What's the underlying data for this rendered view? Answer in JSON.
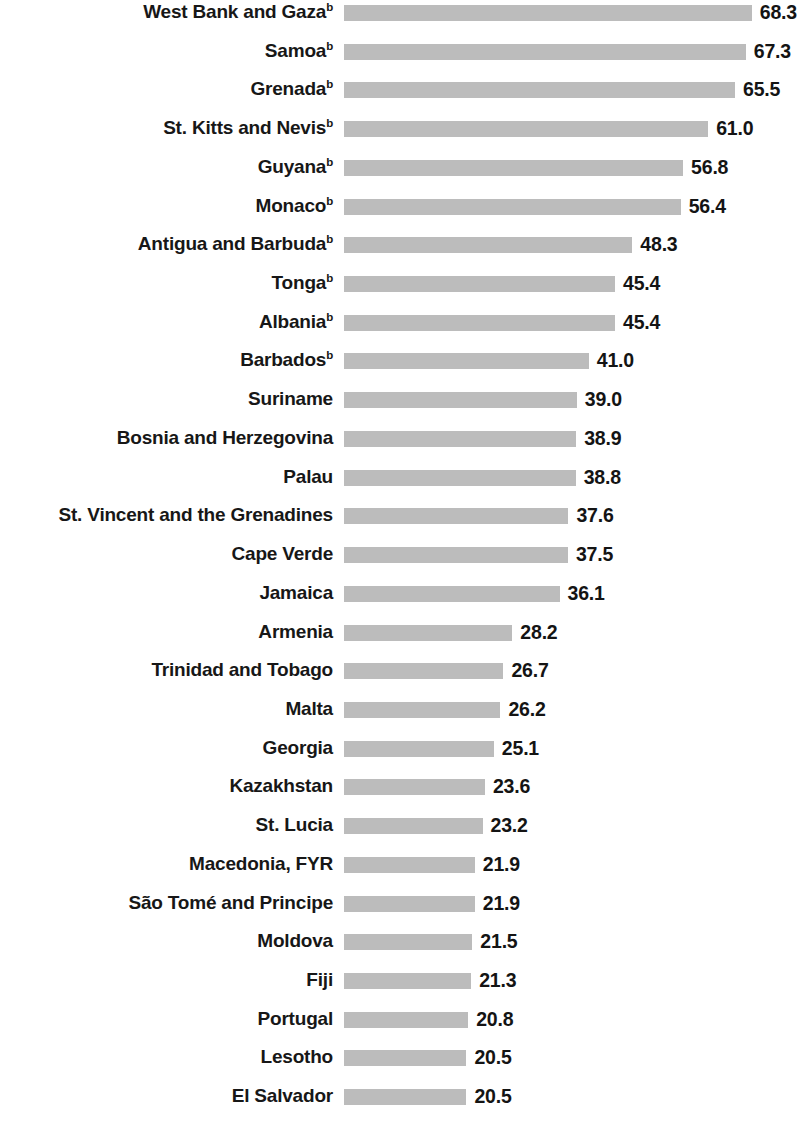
{
  "chart_data": {
    "type": "bar",
    "orientation": "horizontal",
    "title": "",
    "subtitle": "",
    "xlabel": "",
    "ylabel": "",
    "grid": false,
    "legend": null,
    "axis_visible": false,
    "value_label_format": "one decimal",
    "xlim": [
      0,
      68.3
    ],
    "bar_color": "#bcbcbc",
    "text_color": "#171717",
    "footnote_marker": "b",
    "categories": [
      "West Bank and Gaza",
      "Samoa",
      "Grenada",
      "St. Kitts and Nevis",
      "Guyana",
      "Monaco",
      "Antigua and Barbuda",
      "Tonga",
      "Albania",
      "Barbados",
      "Suriname",
      "Bosnia and Herzegovina",
      "Palau",
      "St. Vincent and the Grenadines",
      "Cape Verde",
      "Jamaica",
      "Armenia",
      "Trinidad and Tobago",
      "Malta",
      "Georgia",
      "Kazakhstan",
      "St. Lucia",
      "Macedonia, FYR",
      "São Tomé and Principe",
      "Moldova",
      "Fiji",
      "Portugal",
      "Lesotho",
      "El Salvador"
    ],
    "values": [
      68.3,
      67.3,
      65.5,
      61.0,
      56.8,
      56.4,
      48.3,
      45.4,
      45.4,
      41.0,
      39.0,
      38.9,
      38.8,
      37.6,
      37.5,
      36.1,
      28.2,
      26.7,
      26.2,
      25.1,
      23.6,
      23.2,
      21.9,
      21.9,
      21.5,
      21.3,
      20.8,
      20.5,
      20.5
    ],
    "rows": [
      {
        "label": "West Bank and Gaza",
        "marker": "b",
        "value": 68.3,
        "value_text": "68.3"
      },
      {
        "label": "Samoa",
        "marker": "b",
        "value": 67.3,
        "value_text": "67.3"
      },
      {
        "label": "Grenada",
        "marker": "b",
        "value": 65.5,
        "value_text": "65.5"
      },
      {
        "label": "St. Kitts and Nevis",
        "marker": "b",
        "value": 61.0,
        "value_text": "61.0"
      },
      {
        "label": "Guyana",
        "marker": "b",
        "value": 56.8,
        "value_text": "56.8"
      },
      {
        "label": "Monaco",
        "marker": "b",
        "value": 56.4,
        "value_text": "56.4"
      },
      {
        "label": "Antigua and Barbuda",
        "marker": "b",
        "value": 48.3,
        "value_text": "48.3"
      },
      {
        "label": "Tonga",
        "marker": "b",
        "value": 45.4,
        "value_text": "45.4"
      },
      {
        "label": "Albania",
        "marker": "b",
        "value": 45.4,
        "value_text": "45.4"
      },
      {
        "label": "Barbados",
        "marker": "b",
        "value": 41.0,
        "value_text": "41.0"
      },
      {
        "label": "Suriname",
        "marker": "",
        "value": 39.0,
        "value_text": "39.0"
      },
      {
        "label": "Bosnia and Herzegovina",
        "marker": "",
        "value": 38.9,
        "value_text": "38.9"
      },
      {
        "label": "Palau",
        "marker": "",
        "value": 38.8,
        "value_text": "38.8"
      },
      {
        "label": "St. Vincent and the Grenadines",
        "marker": "",
        "value": 37.6,
        "value_text": "37.6"
      },
      {
        "label": "Cape Verde",
        "marker": "",
        "value": 37.5,
        "value_text": "37.5"
      },
      {
        "label": "Jamaica",
        "marker": "",
        "value": 36.1,
        "value_text": "36.1"
      },
      {
        "label": "Armenia",
        "marker": "",
        "value": 28.2,
        "value_text": "28.2"
      },
      {
        "label": "Trinidad and Tobago",
        "marker": "",
        "value": 26.7,
        "value_text": "26.7"
      },
      {
        "label": "Malta",
        "marker": "",
        "value": 26.2,
        "value_text": "26.2"
      },
      {
        "label": "Georgia",
        "marker": "",
        "value": 25.1,
        "value_text": "25.1"
      },
      {
        "label": "Kazakhstan",
        "marker": "",
        "value": 23.6,
        "value_text": "23.6"
      },
      {
        "label": "St. Lucia",
        "marker": "",
        "value": 23.2,
        "value_text": "23.2"
      },
      {
        "label": "Macedonia, FYR",
        "marker": "",
        "value": 21.9,
        "value_text": "21.9"
      },
      {
        "label": "São Tomé and Principe",
        "marker": "",
        "value": 21.9,
        "value_text": "21.9"
      },
      {
        "label": "Moldova",
        "marker": "",
        "value": 21.5,
        "value_text": "21.5"
      },
      {
        "label": "Fiji",
        "marker": "",
        "value": 21.3,
        "value_text": "21.3"
      },
      {
        "label": "Portugal",
        "marker": "",
        "value": 20.8,
        "value_text": "20.8"
      },
      {
        "label": "Lesotho",
        "marker": "",
        "value": 20.5,
        "value_text": "20.5"
      },
      {
        "label": "El Salvador",
        "marker": "",
        "value": 20.5,
        "value_text": "20.5"
      }
    ]
  }
}
